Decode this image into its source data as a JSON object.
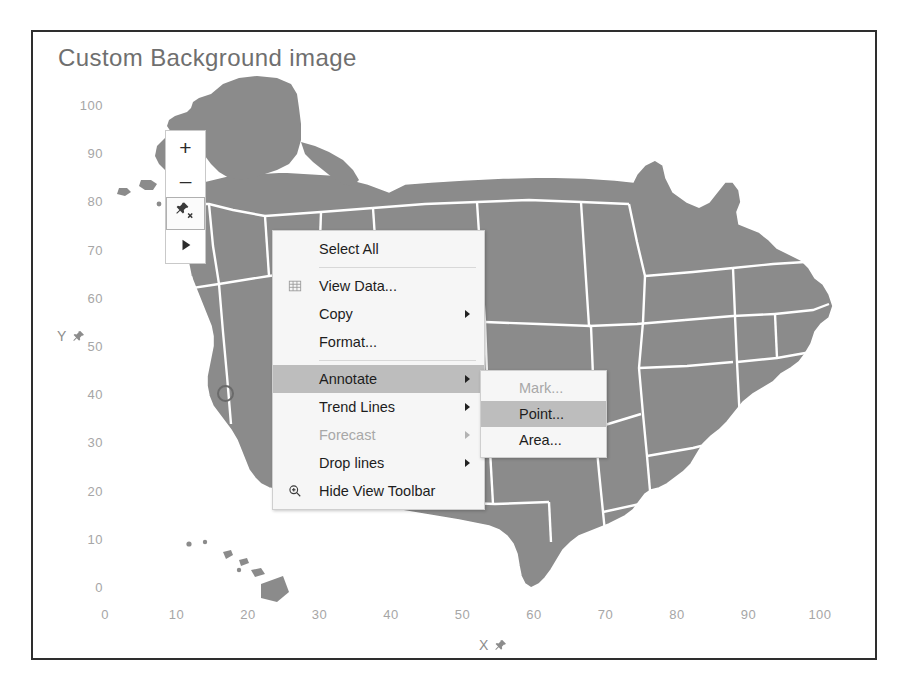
{
  "viz": {
    "title": "Custom Background image",
    "background_color": "#ffffff",
    "border_color": "#2e2e2e",
    "map_fill_color": "#8b8b8b",
    "map_border_color": "#ffffff"
  },
  "axes": {
    "x": {
      "title": "X",
      "pin_icon": "pin-icon",
      "ticks": [
        "0",
        "10",
        "20",
        "30",
        "40",
        "50",
        "60",
        "70",
        "80",
        "90",
        "100"
      ],
      "min": 0,
      "max": 100,
      "step": 10
    },
    "y": {
      "title": "Y",
      "pin_icon": "pin-icon",
      "ticks": [
        "100",
        "90",
        "80",
        "70",
        "60",
        "50",
        "40",
        "30",
        "20",
        "10",
        "0"
      ],
      "min": 0,
      "max": 100,
      "step": 10
    }
  },
  "toolbar": {
    "buttons": [
      {
        "name": "zoom-in-button",
        "icon": "plus-icon",
        "label": "+",
        "selected": false
      },
      {
        "name": "zoom-out-button",
        "icon": "minus-icon",
        "label": "–",
        "selected": false
      },
      {
        "name": "unpin-button",
        "icon": "pin-x-icon",
        "label": "",
        "selected": true
      },
      {
        "name": "pan-button",
        "icon": "play-arrow-icon",
        "label": "",
        "selected": false
      }
    ]
  },
  "context_menu": {
    "items": [
      {
        "label": "Select All",
        "icon": null,
        "has_submenu": false,
        "disabled": false,
        "highlight": false,
        "separator_after": true
      },
      {
        "label": "View Data...",
        "icon": "table-grid-icon",
        "has_submenu": false,
        "disabled": false,
        "highlight": false,
        "separator_after": false
      },
      {
        "label": "Copy",
        "icon": null,
        "has_submenu": true,
        "disabled": false,
        "highlight": false,
        "separator_after": false
      },
      {
        "label": "Format...",
        "icon": null,
        "has_submenu": false,
        "disabled": false,
        "highlight": false,
        "separator_after": true
      },
      {
        "label": "Annotate",
        "icon": null,
        "has_submenu": true,
        "disabled": false,
        "highlight": true,
        "separator_after": false
      },
      {
        "label": "Trend Lines",
        "icon": null,
        "has_submenu": true,
        "disabled": false,
        "highlight": false,
        "separator_after": false
      },
      {
        "label": "Forecast",
        "icon": null,
        "has_submenu": true,
        "disabled": true,
        "highlight": false,
        "separator_after": false
      },
      {
        "label": "Drop lines",
        "icon": null,
        "has_submenu": true,
        "disabled": false,
        "highlight": false,
        "separator_after": false
      },
      {
        "label": "Hide View Toolbar",
        "icon": "magnifier-icon",
        "has_submenu": false,
        "disabled": false,
        "highlight": false,
        "separator_after": false
      }
    ],
    "highlight_color": "#bdbdbd",
    "background_color": "#f6f6f6"
  },
  "annotate_submenu": {
    "items": [
      {
        "label": "Mark...",
        "disabled": true,
        "highlight": false
      },
      {
        "label": "Point...",
        "disabled": false,
        "highlight": true
      },
      {
        "label": "Area...",
        "disabled": false,
        "highlight": false
      }
    ]
  },
  "chart_data": {
    "type": "scatter",
    "title": "Custom Background image",
    "xlabel": "X",
    "ylabel": "Y",
    "xlim": [
      0,
      100
    ],
    "ylim": [
      0,
      100
    ],
    "xticks": [
      0,
      10,
      20,
      30,
      40,
      50,
      60,
      70,
      80,
      90,
      100
    ],
    "yticks": [
      0,
      10,
      20,
      30,
      40,
      50,
      60,
      70,
      80,
      90,
      100
    ],
    "grid": false,
    "legend": "none",
    "background_image": "United States map (contiguous states, Alaska, Hawaii) shown as custom background",
    "marks": [
      {
        "name": "circle-mark",
        "x": 14,
        "y": 44,
        "shape": "circle",
        "filled": false
      }
    ]
  }
}
